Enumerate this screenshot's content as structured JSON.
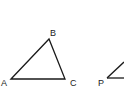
{
  "diagram": {
    "triangle_abc": {
      "labels": {
        "a": "A",
        "b": "B",
        "c": "C"
      }
    },
    "triangle_p": {
      "labels": {
        "p": "P"
      }
    },
    "stroke_color": "#1a1a1a"
  }
}
